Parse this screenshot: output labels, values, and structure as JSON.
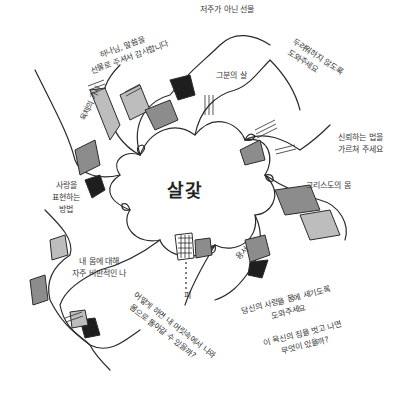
{
  "diagram": {
    "center": {
      "label": "살갗"
    },
    "branches": [
      {
        "id": "thanks",
        "lines": [
          "하나님, 말씀을",
          "선물로 주셔서 감사합니다"
        ]
      },
      {
        "id": "not-curse",
        "lines": [
          "저주가 아닌 선물"
        ]
      },
      {
        "id": "help-not-fear",
        "lines": [
          "두려워하지 않도록",
          "도와주세요"
        ]
      },
      {
        "id": "his-flesh",
        "lines": [
          "그분의 살"
        ]
      },
      {
        "id": "teach-trust",
        "lines": [
          "신뢰하는 법을",
          "가르쳐 주세요"
        ]
      },
      {
        "id": "body-of-christ",
        "lines": [
          "그리스도의 몸"
        ]
      },
      {
        "id": "thorn",
        "lines": [
          "육체의 가시"
        ]
      },
      {
        "id": "express-love",
        "lines": [
          "사랑을",
          "표현하는",
          "방법"
        ]
      },
      {
        "id": "self-critical",
        "lines": [
          "내 몸에 대해",
          "자주 비판적인 나"
        ]
      },
      {
        "id": "blood",
        "lines": [
          "피"
        ]
      },
      {
        "id": "acceptance",
        "lines": [
          "용서"
        ]
      },
      {
        "id": "how-return",
        "lines": [
          "어떻게 하면 내 머릿속에서 나와",
          "몸으로 돌아갈 수 있을까?"
        ]
      },
      {
        "id": "love-in-body",
        "lines": [
          "당신의 사랑을 몸에 새기도록",
          "도와주세요"
        ]
      },
      {
        "id": "after-burden",
        "lines": [
          "이 육신의 짐을 벗고 나면",
          "무엇이 있을까?"
        ]
      }
    ],
    "colors": {
      "ink": "#2b2b2b",
      "dark_fill": "#1e1e1e",
      "mid_fill": "#8c8c8c",
      "light_fill": "#bdbdbd",
      "paper": "#ffffff"
    }
  }
}
